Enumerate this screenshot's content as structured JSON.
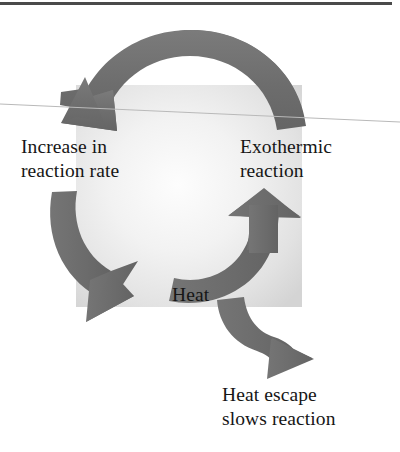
{
  "figure": {
    "background_color": "#ffffff",
    "arrow_color": "#6f6f6f",
    "text_color": "#161616",
    "panel_color": "#d9d9d9",
    "rule_color": "#4a4a4a",
    "hairline_color": "#b8b8b8"
  },
  "labels": {
    "increase_rate": "Increase in\nreaction rate",
    "exothermic": "Exothermic\nreaction",
    "heat": "Heat",
    "heat_escape": "Heat escape\nslows reaction"
  },
  "arrows": [
    {
      "name": "arrow-top-curve",
      "from": "Exothermic reaction",
      "to": "Increase in reaction rate",
      "direction": "right-to-left across the top, arrowhead pointing down-left"
    },
    {
      "name": "arrow-left-curve",
      "from": "Increase in reaction rate",
      "to": "Heat",
      "direction": "top-to-bottom down the left side, arrowhead pointing down-right"
    },
    {
      "name": "arrow-right-curve",
      "from": "Heat",
      "to": "Exothermic reaction",
      "direction": "bottom-to-top up the right side, arrowhead pointing up"
    },
    {
      "name": "arrow-heat-escape",
      "from": "Heat",
      "to": "Heat escape slows reaction",
      "direction": "S-curve branching down and to the right, arrowhead pointing right"
    }
  ],
  "decorations": {
    "top_rule": "horizontal page rule across the top edge",
    "scan_hairline": "faint diagonal scan line crossing the figure"
  }
}
